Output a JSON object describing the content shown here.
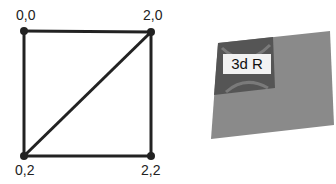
{
  "left_diagram": {
    "vertices": [
      {
        "label": "0,0",
        "x": 24,
        "y": 31
      },
      {
        "label": "2,0",
        "x": 151,
        "y": 32
      },
      {
        "label": "0,2",
        "x": 24,
        "y": 156
      },
      {
        "label": "2,2",
        "x": 151,
        "y": 156
      }
    ],
    "edges": [
      [
        "0,0",
        "2,0"
      ],
      [
        "2,0",
        "2,2"
      ],
      [
        "2,2",
        "0,2"
      ],
      [
        "0,2",
        "0,0"
      ],
      [
        "0,2",
        "2,0"
      ]
    ]
  },
  "right_diagram": {
    "texture_label": "3d R",
    "quad_color": "#8a8a8a",
    "texture_color": "#555555"
  },
  "colors": {
    "line": "#222222",
    "background": "#ffffff"
  }
}
